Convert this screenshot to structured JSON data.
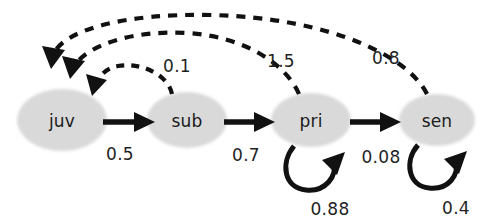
{
  "diagram": {
    "type": "state-transition-life-cycle-graph",
    "background_color": "#ffffff",
    "node_fill_color": "#d9d9d9",
    "solid_edge_color": "#111111",
    "dashed_edge_color": "#111111",
    "label_color": "#1b1b1b",
    "nodes": [
      {
        "id": "juv",
        "label": "juv",
        "cx": 62,
        "cy": 120,
        "rx": 45,
        "ry": 31
      },
      {
        "id": "sub",
        "label": "sub",
        "cx": 187,
        "cy": 120,
        "rx": 40,
        "ry": 28
      },
      {
        "id": "pri",
        "label": "pri",
        "cx": 311,
        "cy": 120,
        "rx": 40,
        "ry": 27
      },
      {
        "id": "sen",
        "label": "sen",
        "cx": 437,
        "cy": 120,
        "rx": 38,
        "ry": 26
      }
    ],
    "solid_edges": [
      {
        "id": "juv-sub",
        "from": "juv",
        "to": "sub",
        "weight": "0.5",
        "label_x": 120,
        "label_y": 154
      },
      {
        "id": "sub-pri",
        "from": "sub",
        "to": "pri",
        "weight": "0.7",
        "label_x": 246,
        "label_y": 155
      },
      {
        "id": "pri-sen",
        "from": "pri",
        "to": "sen",
        "weight": "0.08",
        "label_x": 381,
        "label_y": 157
      }
    ],
    "self_loops": [
      {
        "id": "pri-pri",
        "node": "pri",
        "weight": "0.88",
        "label_x": 330,
        "label_y": 209
      },
      {
        "id": "sen-sen",
        "node": "sen",
        "weight": "0.4",
        "label_x": 456,
        "label_y": 208
      }
    ],
    "dashed_edges": [
      {
        "id": "sub-juv",
        "from": "sub",
        "to": "juv",
        "weight": "0.1",
        "label_x": 177,
        "label_y": 66
      },
      {
        "id": "pri-juv",
        "from": "pri",
        "to": "juv",
        "weight": "1.5",
        "label_x": 281,
        "label_y": 61
      },
      {
        "id": "sen-juv",
        "from": "sen",
        "to": "juv",
        "weight": "0.8",
        "label_x": 386,
        "label_y": 58
      }
    ]
  }
}
